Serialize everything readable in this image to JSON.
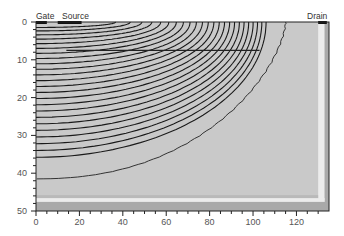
{
  "chart_data": {
    "type": "contour",
    "title": "",
    "xlabel": "",
    "ylabel": "",
    "xlim": [
      0,
      135
    ],
    "ylim": [
      50,
      0
    ],
    "x_ticks": [
      0,
      20,
      40,
      60,
      80,
      100,
      120
    ],
    "y_ticks": [
      0,
      10,
      20,
      30,
      40,
      50
    ],
    "grid": false,
    "legend": null,
    "annotations": [
      {
        "text": "Gate",
        "x": 2,
        "y": 0
      },
      {
        "text": "Source",
        "x": 12,
        "y": 0
      },
      {
        "text": "Drain",
        "x": 132,
        "y": 0
      }
    ],
    "regions": [
      {
        "name": "contour-field",
        "x_range": [
          0,
          134
        ],
        "y_range": [
          0,
          47
        ],
        "fill": "#c8c8c8"
      },
      {
        "name": "light-band",
        "y_range": [
          46,
          47.5
        ],
        "fill": "#e8e8e8"
      },
      {
        "name": "substrate",
        "y_range": [
          47.5,
          50
        ],
        "fill": "#a8a8a8"
      },
      {
        "name": "right-edge-band",
        "x_range": [
          130,
          133
        ],
        "fill": "#e0e0e0"
      }
    ],
    "contour_count": 24,
    "outermost_contour_depth_at_x0": 41.5,
    "contour_x_extent_at_surface": [
      0,
      115
    ]
  },
  "labels": {
    "gate": "Gate",
    "source": "Source",
    "drain": "Drain"
  },
  "axes": {
    "x_tick_labels": [
      "0",
      "20",
      "40",
      "60",
      "80",
      "100",
      "120"
    ],
    "y_tick_labels": [
      "0",
      "10",
      "20",
      "30",
      "40",
      "50"
    ]
  },
  "colors": {
    "field": "#c9c9c9",
    "contour": "#1a1a1a",
    "substrate": "#a9a9a9",
    "band": "#ececec",
    "axis": "#222222",
    "electrode": "#111111"
  }
}
